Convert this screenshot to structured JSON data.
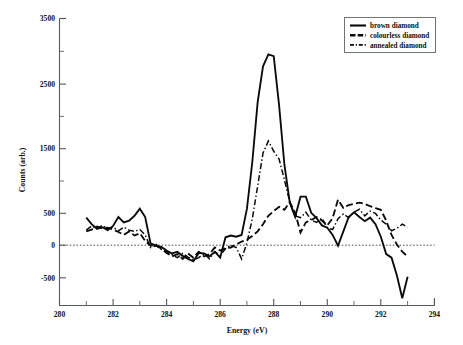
{
  "chart_data": {
    "type": "line",
    "title": "",
    "xlabel": "Energy (eV)",
    "ylabel": "Counts (arb.)",
    "xlim": [
      280,
      294
    ],
    "ylim": [
      -1300,
      3500
    ],
    "xticks": [
      280,
      282,
      284,
      286,
      288,
      290,
      292,
      294
    ],
    "xticklabels": [
      "280",
      "282",
      "284",
      "286",
      "288",
      "290",
      "292",
      "294"
    ],
    "yticks": [
      -500,
      0,
      500,
      1500,
      2500,
      3500
    ],
    "yticklabels": [
      "-500",
      "0",
      "500",
      "1500",
      "2500",
      "3500"
    ],
    "yticks_minor": [
      1000,
      2000,
      3000
    ],
    "grid": false,
    "zero_reference_line": 0,
    "legend_position": "top-right",
    "series": [
      {
        "name": "brown diamond",
        "style": "solid",
        "color": "#0a0a0a",
        "x": [
          281.0,
          281.2,
          281.4,
          281.6,
          281.8,
          282.0,
          282.2,
          282.4,
          282.6,
          282.8,
          283.0,
          283.2,
          283.4,
          283.6,
          283.8,
          284.0,
          284.2,
          284.4,
          284.6,
          284.8,
          285.0,
          285.2,
          285.4,
          285.6,
          285.8,
          286.0,
          286.2,
          286.4,
          286.6,
          286.8,
          287.0,
          287.2,
          287.4,
          287.6,
          287.8,
          288.0,
          288.2,
          288.4,
          288.6,
          288.8,
          289.0,
          289.2,
          289.4,
          289.6,
          289.8,
          290.0,
          290.2,
          290.4,
          290.6,
          290.8,
          291.0,
          291.2,
          291.4,
          291.6,
          291.8,
          292.0,
          292.2,
          292.4,
          292.6,
          292.8,
          293.0
        ],
        "y": [
          170,
          60,
          -20,
          10,
          -40,
          30,
          180,
          90,
          120,
          200,
          320,
          180,
          -260,
          -300,
          -320,
          -380,
          -430,
          -400,
          -470,
          -520,
          -560,
          -420,
          -430,
          -480,
          -400,
          -500,
          -160,
          -130,
          -150,
          -120,
          320,
          1100,
          2100,
          2700,
          2900,
          2870,
          2050,
          1050,
          420,
          180,
          520,
          520,
          250,
          160,
          40,
          0,
          -120,
          -300,
          -60,
          180,
          260,
          180,
          110,
          170,
          60,
          -150,
          -440,
          -500,
          -800,
          -1180,
          -820
        ]
      },
      {
        "name": "colourless diamond",
        "style": "dashed",
        "color": "#0a0a0a",
        "x": [
          281.0,
          281.2,
          281.4,
          281.6,
          281.8,
          282.0,
          282.2,
          282.4,
          282.6,
          282.8,
          283.0,
          283.2,
          283.4,
          283.6,
          283.8,
          284.0,
          284.2,
          284.4,
          284.6,
          284.8,
          285.0,
          285.2,
          285.4,
          285.6,
          285.8,
          286.0,
          286.2,
          286.4,
          286.6,
          286.8,
          287.0,
          287.2,
          287.4,
          287.6,
          287.8,
          288.0,
          288.2,
          288.4,
          288.6,
          288.8,
          289.0,
          289.2,
          289.4,
          289.6,
          289.8,
          290.0,
          290.2,
          290.4,
          290.6,
          290.8,
          291.0,
          291.2,
          291.4,
          291.6,
          291.8,
          292.0,
          292.2,
          292.4,
          292.6,
          292.8,
          293.0
        ],
        "y": [
          -60,
          -30,
          20,
          -10,
          0,
          -30,
          -70,
          -120,
          -60,
          -130,
          -90,
          -220,
          -300,
          -280,
          -350,
          -420,
          -480,
          -440,
          -520,
          -430,
          -500,
          -400,
          -480,
          -440,
          -330,
          -380,
          -340,
          -330,
          -280,
          -230,
          -200,
          -140,
          -60,
          60,
          200,
          280,
          350,
          300,
          430,
          250,
          -80,
          90,
          130,
          180,
          120,
          40,
          160,
          470,
          330,
          380,
          400,
          420,
          400,
          360,
          330,
          300,
          120,
          -120,
          -280,
          -400,
          -480
        ]
      },
      {
        "name": "annealed diamond",
        "style": "dashdot",
        "color": "#0a0a0a",
        "x": [
          281.0,
          281.2,
          281.4,
          281.6,
          281.8,
          282.0,
          282.2,
          282.4,
          282.6,
          282.8,
          283.0,
          283.2,
          283.4,
          283.6,
          283.8,
          284.0,
          284.2,
          284.4,
          284.6,
          284.8,
          285.0,
          285.2,
          285.4,
          285.6,
          285.8,
          286.0,
          286.2,
          286.4,
          286.6,
          286.8,
          287.0,
          287.2,
          287.4,
          287.6,
          287.8,
          288.0,
          288.2,
          288.4,
          288.6,
          288.8,
          289.0,
          289.2,
          289.4,
          289.6,
          289.8,
          290.0,
          290.2,
          290.4,
          290.6,
          290.8,
          291.0,
          291.2,
          291.4,
          291.6,
          291.8,
          292.0,
          292.2,
          292.4,
          292.6,
          292.8,
          293.0
        ],
        "y": [
          -40,
          30,
          -10,
          40,
          -20,
          10,
          -50,
          10,
          -40,
          -60,
          -30,
          -120,
          -330,
          -300,
          -360,
          -400,
          -450,
          -500,
          -430,
          -490,
          -540,
          -500,
          -430,
          -520,
          -400,
          -460,
          -350,
          -290,
          -330,
          -520,
          -250,
          150,
          700,
          1250,
          1450,
          1280,
          1150,
          800,
          430,
          200,
          170,
          260,
          130,
          90,
          160,
          0,
          -30,
          150,
          230,
          170,
          260,
          310,
          200,
          280,
          240,
          130,
          60,
          -50,
          -10,
          60,
          10
        ]
      }
    ],
    "peak_annotations": {
      "brown_peak_energy": 288.0,
      "brown_peak_counts": 2900,
      "annealed_peak_energy": 287.8,
      "annealed_peak_counts": 1450
    }
  },
  "legend": {
    "entries": [
      {
        "label": "brown diamond",
        "style": "solid"
      },
      {
        "label": "colourless diamond",
        "style": "dashed"
      },
      {
        "label": "annealed diamond",
        "style": "dashdot"
      }
    ]
  }
}
